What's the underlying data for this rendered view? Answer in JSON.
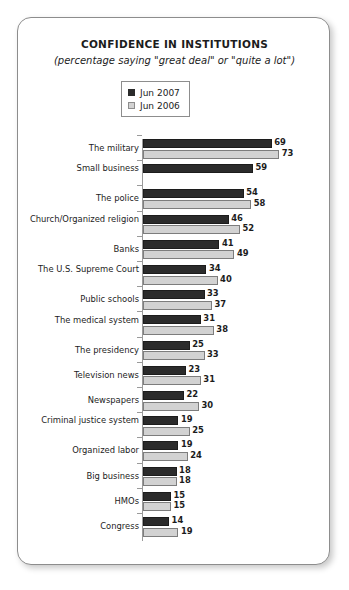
{
  "card": {
    "title": "CONFIDENCE IN INSTITUTIONS",
    "subtitle": "(percentage saying \"great deal\" or \"quite a lot\")"
  },
  "legend": {
    "items": [
      {
        "label": "Jun 2007",
        "color": "#2b2b2b",
        "swatch": "filled-dark-square"
      },
      {
        "label": "Jun 2006",
        "color": "#d2d2d2",
        "swatch": "filled-light-square"
      }
    ]
  },
  "chart_data": {
    "type": "bar",
    "orientation": "horizontal",
    "title": "CONFIDENCE IN INSTITUTIONS",
    "subtitle": "(percentage saying \"great deal\" or \"quite a lot\")",
    "xlabel": "",
    "ylabel": "",
    "xlim": [
      0,
      80
    ],
    "grid": false,
    "legend_position": "top-center",
    "value_labels": true,
    "categories": [
      "The military",
      "Small business",
      "The police",
      "Church/Organized religion",
      "Banks",
      "The U.S. Supreme Court",
      "Public schools",
      "The medical system",
      "The presidency",
      "Television news",
      "Newspapers",
      "Criminal justice system",
      "Organized labor",
      "Big business",
      "HMOs",
      "Congress"
    ],
    "series": [
      {
        "name": "Jun 2007",
        "color": "#2b2b2b",
        "values": [
          69,
          59,
          54,
          46,
          41,
          34,
          33,
          31,
          25,
          23,
          22,
          19,
          19,
          18,
          15,
          14
        ]
      },
      {
        "name": "Jun 2006",
        "color": "#d2d2d2",
        "values": [
          73,
          null,
          58,
          52,
          49,
          40,
          37,
          38,
          33,
          31,
          30,
          25,
          24,
          18,
          15,
          19
        ]
      }
    ]
  }
}
